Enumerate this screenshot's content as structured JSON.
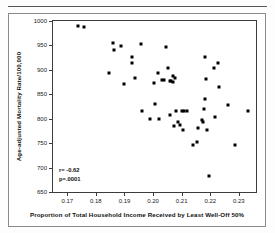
{
  "figure": {
    "y_axis_title": "Age-adjusted Mortality Rate/100,000",
    "x_axis_title": "Proportion of Total Household Income Received by Least Well-Off 50%",
    "stats": {
      "correlation": "r= -0.62",
      "pvalue": "p=.0001"
    }
  },
  "chart_data": {
    "type": "scatter",
    "title": "",
    "xlabel": "Proportion of Total Household Income Received by Least Well-Off 50%",
    "ylabel": "Age-adjusted Mortality Rate/100,000",
    "xlim": [
      0.165,
      0.236
    ],
    "ylim": [
      650,
      1000
    ],
    "xticks": [
      0.17,
      0.18,
      0.19,
      0.2,
      0.21,
      0.22,
      0.23
    ],
    "xtick_labels": [
      "0.17",
      "0.18",
      "0.19",
      "0.20",
      "0.21",
      "0.22",
      "0.23"
    ],
    "yticks": [
      650,
      700,
      750,
      800,
      850,
      900,
      950,
      1000
    ],
    "ytick_labels": [
      "650",
      "700",
      "750",
      "800",
      "850",
      "900",
      "950",
      "1000"
    ],
    "grid": false,
    "legend": false,
    "marker": "filled-square",
    "marker_color": "#000000",
    "annotations": [
      "r= -0.62",
      "p=.0001"
    ],
    "correlation": -0.62,
    "p_value": 0.0001,
    "n_points": 53,
    "points": [
      [
        0.1738,
        990
      ],
      [
        0.1758,
        988
      ],
      [
        0.1847,
        894
      ],
      [
        0.1861,
        954
      ],
      [
        0.1862,
        941
      ],
      [
        0.1889,
        948
      ],
      [
        0.1897,
        871
      ],
      [
        0.1925,
        927
      ],
      [
        0.1928,
        915
      ],
      [
        0.1938,
        884
      ],
      [
        0.1958,
        953
      ],
      [
        0.1962,
        816
      ],
      [
        0.1988,
        799
      ],
      [
        0.2002,
        874
      ],
      [
        0.2008,
        831
      ],
      [
        0.2018,
        893
      ],
      [
        0.2022,
        799
      ],
      [
        0.2032,
        880
      ],
      [
        0.2038,
        879
      ],
      [
        0.2046,
        946
      ],
      [
        0.2052,
        904
      ],
      [
        0.2058,
        808
      ],
      [
        0.2068,
        887
      ],
      [
        0.207,
        876
      ],
      [
        0.2072,
        786
      ],
      [
        0.2078,
        883
      ],
      [
        0.208,
        815
      ],
      [
        0.2088,
        793
      ],
      [
        0.2094,
        788
      ],
      [
        0.21,
        816
      ],
      [
        0.2104,
        777
      ],
      [
        0.2118,
        816
      ],
      [
        0.2139,
        747
      ],
      [
        0.2152,
        752
      ],
      [
        0.2158,
        782
      ],
      [
        0.2172,
        797
      ],
      [
        0.2176,
        793
      ],
      [
        0.2178,
        819
      ],
      [
        0.218,
        841
      ],
      [
        0.2182,
        927
      ],
      [
        0.2186,
        882
      ],
      [
        0.219,
        776
      ],
      [
        0.2194,
        683
      ],
      [
        0.2212,
        903
      ],
      [
        0.2218,
        804
      ],
      [
        0.2226,
        915
      ],
      [
        0.2232,
        864
      ],
      [
        0.2262,
        828
      ],
      [
        0.2288,
        746
      ],
      [
        0.2332,
        815
      ],
      [
        0.206,
        878
      ],
      [
        0.2064,
        877
      ],
      [
        0.2108,
        815
      ]
    ]
  }
}
